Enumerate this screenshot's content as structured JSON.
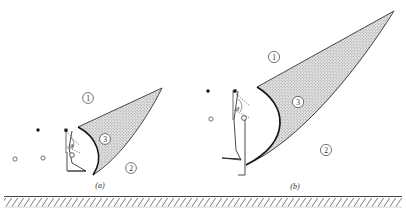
{
  "figure": {
    "background": "#ffffff",
    "ink": "#2b2b2b",
    "stipple_fill": "#d9d9d9",
    "ground_hatch_color": "#6e6e6e",
    "panels": [
      {
        "id": "a",
        "caption": "(a)",
        "caption_pos": [
          100,
          186
        ],
        "region_labels": [
          {
            "text": "1",
            "pos": [
              88,
              98
            ]
          },
          {
            "text": "3",
            "pos": [
              105,
              139
            ]
          },
          {
            "text": "2",
            "pos": [
              131,
              168
            ]
          }
        ],
        "angle_label": {
          "text": "θ",
          "pos": [
            71,
            146
          ]
        },
        "apex": [
          162,
          88
        ],
        "wedge_top_root": [
          78,
          127
        ],
        "wedge_bottom_root": [
          92,
          174
        ],
        "bow_top": [
          78,
          127
        ],
        "bow_bottom": [
          93,
          175
        ],
        "bow_bulge_x": 109,
        "origin": [
          67,
          152
        ],
        "body_top": [
          72,
          131
        ],
        "body_corner": [
          86,
          171
        ],
        "body_foot": [
          68,
          171
        ],
        "particles_filled": [
          [
            38,
            130
          ],
          [
            66,
            131
          ]
        ],
        "particles_open": [
          [
            15,
            159
          ],
          [
            43,
            158
          ],
          [
            73,
            155
          ],
          [
            67,
            152
          ]
        ]
      },
      {
        "id": "b",
        "caption": "(b)",
        "caption_pos": [
          295,
          187
        ],
        "region_labels": [
          {
            "text": "1",
            "pos": [
              274,
              57
            ]
          },
          {
            "text": "3",
            "pos": [
              298,
              102
            ]
          },
          {
            "text": "2",
            "pos": [
              326,
              150
            ]
          }
        ],
        "angle_label": {
          "text": "θ",
          "pos": [
            234,
            108
          ]
        },
        "apex": [
          394,
          11
        ],
        "wedge_top_root": [
          257,
          87
        ],
        "wedge_bottom_root": [
          244,
          165
        ],
        "bow_top": [
          258,
          87
        ],
        "bow_bottom": [
          246,
          165
        ],
        "bow_bulge_x": 283,
        "origin": [
          245,
          118
        ],
        "body_top": [
          238,
          91
        ],
        "body_corner": [
          240,
          160
        ],
        "body_foot": [
          222,
          158
        ],
        "particles_filled": [
          [
            208,
            91
          ],
          [
            235,
            91
          ]
        ],
        "particles_open": [
          [
            211,
            119
          ],
          [
            240,
            119
          ]
        ]
      }
    ],
    "ground": {
      "y_top": 196,
      "y_bottom": 207,
      "x_start": 4,
      "x_end": 402,
      "hatch_label": "hatched-ground-band"
    }
  }
}
